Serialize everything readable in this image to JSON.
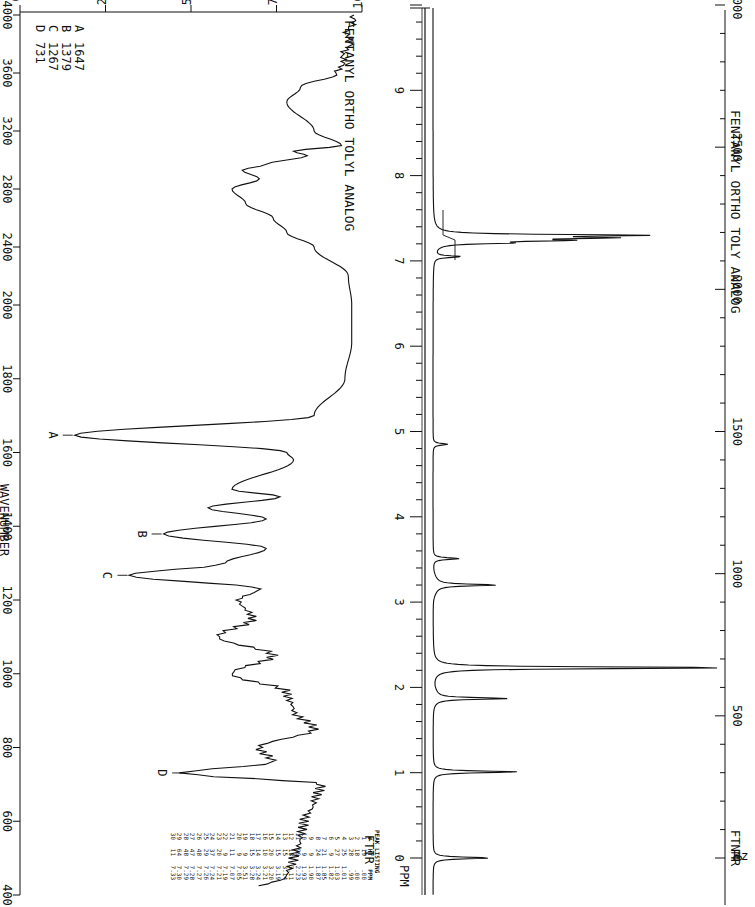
{
  "nmr": {
    "instrument_label": "FTNMR",
    "compound_label": "FENTANYL ORTHO TOLY ANALOG",
    "hz_axis_unit": "Hz",
    "ppm_axis_unit": "PPM",
    "hz_ticks": [
      "0",
      "500",
      "1000",
      "1500",
      "2000",
      "2500",
      "3000"
    ],
    "ppm_ticks": [
      "0",
      "1",
      "2",
      "3",
      "4",
      "5",
      "6",
      "7",
      "8",
      "9"
    ],
    "peak_listing": {
      "title": "PEAK LISTING",
      "headers": [
        "#",
        "HT",
        "PPM"
      ],
      "rows": [
        [
          "1",
          "19",
          ".00"
        ],
        [
          "2",
          "18",
          ".00"
        ],
        [
          "3",
          "28",
          ".99"
        ],
        [
          "4",
          "25",
          "1.01"
        ],
        [
          "5",
          "27",
          "1.03"
        ],
        [
          "6",
          "9",
          "1.82"
        ],
        [
          "7",
          "21",
          "1.85"
        ],
        [
          "8",
          "24",
          "1.87"
        ],
        [
          "9",
          "9",
          "1.90"
        ],
        [
          "10",
          "9",
          "1.93"
        ],
        [
          "11",
          "99",
          "2.23"
        ],
        [
          "12",
          "13",
          "3.11"
        ],
        [
          "13",
          "15",
          "3.14"
        ],
        [
          "14",
          "15",
          "3.19"
        ],
        [
          "15",
          "20",
          "3.20"
        ],
        [
          "16",
          "10",
          "3.21"
        ],
        [
          "17",
          "14",
          "3.24"
        ],
        [
          "18",
          "15",
          "3.28"
        ],
        [
          "19",
          "9",
          "3.51"
        ],
        [
          "20",
          "9",
          "7.05"
        ],
        [
          "21",
          "11",
          "7.07"
        ],
        [
          "22",
          "9",
          "7.19"
        ],
        [
          "23",
          "20",
          "7.21"
        ],
        [
          "24",
          "37",
          "7.24"
        ],
        [
          "25",
          "29",
          "7.26"
        ],
        [
          "26",
          "48",
          "7.27"
        ],
        [
          "27",
          "47",
          "7.28"
        ],
        [
          "28",
          "48",
          "7.29"
        ],
        [
          "29",
          "64",
          "7.30"
        ],
        [
          "30",
          "11",
          "7.33"
        ]
      ]
    }
  },
  "ftir": {
    "instrument_label": "FTIR",
    "compound_label": "FENTANYL ORTHO TOLYL ANALOG",
    "x_label": "WAVENUMBER",
    "y_label": "% TRANSMITTANCE",
    "x_ticks": [
      "4000",
      "3600",
      "3200",
      "2800",
      "2400",
      "2000",
      "1800",
      "1600",
      "1400",
      "1200",
      "1000",
      "800",
      "600",
      "400"
    ],
    "y_ticks": [
      "0",
      "25",
      "50",
      "75",
      "100"
    ],
    "legend": [
      {
        "key": "A",
        "value": "1647"
      },
      {
        "key": "B",
        "value": "1379"
      },
      {
        "key": "C",
        "value": "1267"
      },
      {
        "key": "D",
        "value": "731"
      }
    ]
  },
  "chart_data": [
    {
      "type": "line",
      "title": "FENTANYL ORTHO TOLY ANALOG — FTNMR",
      "xlabel": "PPM",
      "secondary_xlabel": "Hz",
      "ylabel": "",
      "x_reversed": true,
      "xlim": [
        10,
        -0.5
      ],
      "secondary_xlim": [
        3000,
        0
      ],
      "peaks": [
        {
          "ppm": 0.0,
          "height": 19
        },
        {
          "ppm": 1.01,
          "height": 28
        },
        {
          "ppm": 1.87,
          "height": 24
        },
        {
          "ppm": 2.23,
          "height": 99
        },
        {
          "ppm": 3.2,
          "height": 20
        },
        {
          "ppm": 3.51,
          "height": 9
        },
        {
          "ppm": 4.85,
          "height": 5
        },
        {
          "ppm": 7.05,
          "height": 9
        },
        {
          "ppm": 7.21,
          "height": 20
        },
        {
          "ppm": 7.24,
          "height": 37
        },
        {
          "ppm": 7.27,
          "height": 48
        },
        {
          "ppm": 7.3,
          "height": 64
        }
      ],
      "annotations": [
        "FTNMR",
        "PEAK LISTING (30 peaks)"
      ]
    },
    {
      "type": "line",
      "title": "FENTANYL ORTHO TOLYL ANALOG — FTIR",
      "xlabel": "WAVENUMBER",
      "ylabel": "% TRANSMITTANCE",
      "x_reversed": true,
      "xlim": [
        4000,
        400
      ],
      "ylim": [
        0,
        100
      ],
      "x": [
        4000,
        3800,
        3600,
        3500,
        3400,
        3200,
        3100,
        3060,
        3030,
        2970,
        2930,
        2870,
        2800,
        2700,
        2600,
        2500,
        2400,
        2200,
        2000,
        1900,
        1800,
        1700,
        1647,
        1600,
        1580,
        1500,
        1480,
        1450,
        1420,
        1379,
        1340,
        1300,
        1267,
        1230,
        1200,
        1150,
        1100,
        1050,
        1000,
        950,
        900,
        850,
        800,
        760,
        731,
        700,
        650,
        600,
        550,
        500,
        450,
        420
      ],
      "values": [
        97,
        96,
        93,
        82,
        78,
        86,
        94,
        80,
        84,
        72,
        65,
        70,
        62,
        66,
        74,
        78,
        86,
        96,
        97,
        97,
        95,
        86,
        16,
        78,
        80,
        62,
        76,
        55,
        72,
        42,
        72,
        60,
        32,
        70,
        64,
        68,
        58,
        74,
        62,
        78,
        80,
        86,
        70,
        74,
        48,
        88,
        86,
        83,
        82,
        80,
        78,
        70
      ],
      "annotations": [
        {
          "label": "A",
          "x": 1647,
          "value": "1647"
        },
        {
          "label": "B",
          "x": 1379,
          "value": "1379"
        },
        {
          "label": "C",
          "x": 1267,
          "value": "1267"
        },
        {
          "label": "D",
          "x": 731,
          "value": "731"
        }
      ]
    }
  ]
}
